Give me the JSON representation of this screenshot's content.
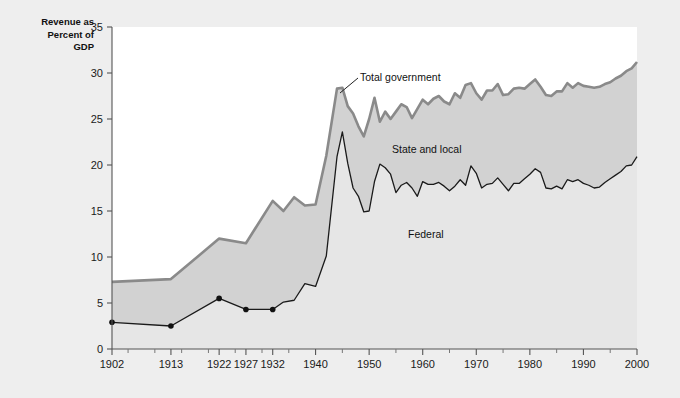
{
  "figure": {
    "background_color": "#eeeeee",
    "plot_background_color": "#ffffff",
    "axis_title": "Revenue as\nPercent of\nGDP"
  },
  "annotations": {
    "total_government": "Total government",
    "state_and_local": "State and local",
    "federal": "Federal"
  },
  "chart_data": {
    "type": "area",
    "title": "",
    "subtitle": "",
    "xlabel": "",
    "ylabel": "Revenue as Percent of GDP",
    "xlim": [
      1902,
      2000
    ],
    "ylim": [
      0,
      35
    ],
    "grid": false,
    "legend_position": "inline-annotations",
    "xticklabels": [
      "1902",
      "1913",
      "1922",
      "1927",
      "1932",
      "1940",
      "1950",
      "1960",
      "1970",
      "1980",
      "1990",
      "2000"
    ],
    "xtickvalues": [
      1902,
      1913,
      1922,
      1927,
      1932,
      1940,
      1950,
      1960,
      1970,
      1980,
      1990,
      2000
    ],
    "xminorticks": [
      1905,
      1910,
      1915,
      1920,
      1925,
      1930,
      1935,
      1945,
      1955,
      1965,
      1975,
      1985,
      1995
    ],
    "yticklabels": [
      "0",
      "5",
      "10",
      "15",
      "20",
      "25",
      "30",
      "35"
    ],
    "ytickvalues": [
      0,
      5,
      10,
      15,
      20,
      25,
      30,
      35
    ],
    "colors": {
      "total_line": "#8a8a8a",
      "federal_line": "#1a1a1a",
      "band_fill": "#d2d2d2",
      "below_federal_fill": "#e6e6e6",
      "marker": "#111111"
    },
    "series": [
      {
        "name": "Total government",
        "marker_years": [
          1902,
          1913,
          1922,
          1927,
          1932
        ],
        "x": [
          1902,
          1913,
          1922,
          1927,
          1932,
          1934,
          1936,
          1938,
          1940,
          1942,
          1944,
          1945,
          1946,
          1947,
          1948,
          1949,
          1950,
          1951,
          1952,
          1953,
          1954,
          1955,
          1956,
          1957,
          1958,
          1959,
          1960,
          1961,
          1962,
          1963,
          1964,
          1965,
          1966,
          1967,
          1968,
          1969,
          1970,
          1971,
          1972,
          1973,
          1974,
          1975,
          1976,
          1977,
          1978,
          1979,
          1980,
          1981,
          1982,
          1983,
          1984,
          1985,
          1986,
          1987,
          1988,
          1989,
          1990,
          1991,
          1992,
          1993,
          1994,
          1995,
          1996,
          1997,
          1998,
          1999,
          2000
        ],
        "values": [
          7.3,
          7.6,
          12.0,
          11.5,
          16.1,
          15.0,
          16.5,
          15.6,
          15.7,
          21.0,
          28.3,
          28.4,
          26.4,
          25.6,
          24.2,
          23.1,
          25.0,
          27.3,
          24.7,
          25.8,
          25.0,
          25.8,
          26.6,
          26.3,
          25.1,
          26.1,
          27.1,
          26.6,
          27.2,
          27.5,
          26.9,
          26.6,
          27.8,
          27.3,
          28.7,
          28.9,
          27.8,
          27.1,
          28.1,
          28.1,
          28.8,
          27.6,
          27.7,
          28.3,
          28.4,
          28.3,
          28.8,
          29.3,
          28.5,
          27.6,
          27.5,
          28.0,
          28.0,
          28.9,
          28.4,
          28.9,
          28.6,
          28.5,
          28.4,
          28.5,
          28.8,
          29.0,
          29.4,
          29.7,
          30.2,
          30.5,
          31.2
        ]
      },
      {
        "name": "Federal",
        "marker_years": [
          1902,
          1913,
          1922,
          1927,
          1932
        ],
        "x": [
          1902,
          1913,
          1922,
          1927,
          1932,
          1934,
          1936,
          1938,
          1940,
          1942,
          1944,
          1945,
          1946,
          1947,
          1948,
          1949,
          1950,
          1951,
          1952,
          1953,
          1954,
          1955,
          1956,
          1957,
          1958,
          1959,
          1960,
          1961,
          1962,
          1963,
          1964,
          1965,
          1966,
          1967,
          1968,
          1969,
          1970,
          1971,
          1972,
          1973,
          1974,
          1975,
          1976,
          1977,
          1978,
          1979,
          1980,
          1981,
          1982,
          1983,
          1984,
          1985,
          1986,
          1987,
          1988,
          1989,
          1990,
          1991,
          1992,
          1993,
          1994,
          1995,
          1996,
          1997,
          1998,
          1999,
          2000
        ],
        "values": [
          2.9,
          2.5,
          5.5,
          4.3,
          4.3,
          5.1,
          5.3,
          7.1,
          6.8,
          10.1,
          20.9,
          23.6,
          20.2,
          17.5,
          16.6,
          14.9,
          15.0,
          18.2,
          20.1,
          19.7,
          19.0,
          17.0,
          17.8,
          18.1,
          17.5,
          16.6,
          18.2,
          17.9,
          17.9,
          18.1,
          17.7,
          17.2,
          17.7,
          18.4,
          17.8,
          19.9,
          19.1,
          17.5,
          17.9,
          18.0,
          18.6,
          17.9,
          17.2,
          18.0,
          18.0,
          18.5,
          19.0,
          19.6,
          19.2,
          17.5,
          17.4,
          17.7,
          17.4,
          18.4,
          18.2,
          18.4,
          18.0,
          17.8,
          17.5,
          17.6,
          18.1,
          18.5,
          18.9,
          19.3,
          19.9,
          20.0,
          20.9
        ]
      }
    ]
  }
}
